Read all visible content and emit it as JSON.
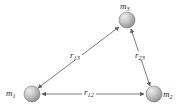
{
  "figure": {
    "type": "three-body-gravitation-diagram",
    "background_color": "#ffffff",
    "line_color": "#6e6e6e",
    "label_color": "#2b2b2b",
    "sphere_fill_light": "#dcdcdc",
    "sphere_fill_dark": "#8d8d8d",
    "sphere_stroke": "#7a7a7a"
  },
  "bodies": [
    {
      "id": "m1",
      "label_base": "m",
      "label_sub": "1",
      "cx": 32,
      "cy": 94,
      "r": 8
    },
    {
      "id": "m2",
      "label_base": "m",
      "label_sub": "2",
      "cx": 154,
      "cy": 94,
      "r": 8
    },
    {
      "id": "m3",
      "label_base": "m",
      "label_sub": "3",
      "cx": 127,
      "cy": 20,
      "r": 8
    }
  ],
  "separations": [
    {
      "id": "r12",
      "label_base": "r",
      "label_sub": "12",
      "from": "m1",
      "to": "m2",
      "arrowheads": "both",
      "orientation": "horizontal"
    },
    {
      "id": "r13",
      "label_base": "r",
      "label_sub": "13",
      "from": "m1",
      "to": "m3",
      "arrowheads": "both",
      "orientation": "diagonal-left"
    },
    {
      "id": "r23",
      "label_base": "r",
      "label_sub": "23",
      "from": "m2",
      "to": "m3",
      "arrowheads": "both",
      "orientation": "diagonal-right"
    }
  ]
}
